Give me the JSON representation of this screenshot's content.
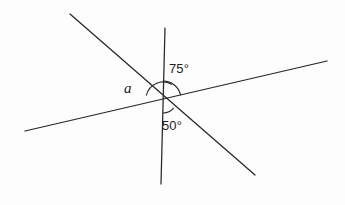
{
  "figure": {
    "background_color": "#fdfdfd",
    "stroke_color": "#272727",
    "text_color": "#1d1d1d",
    "width": 345,
    "height": 205,
    "vertex": {
      "x": 163,
      "y": 99
    },
    "lines": [
      {
        "name": "vertical-line",
        "x1": 165,
        "y1": 28,
        "x2": 161,
        "y2": 184
      },
      {
        "name": "diagonal-line-steep",
        "x1": 70,
        "y1": 14,
        "x2": 255,
        "y2": 175
      },
      {
        "name": "transversal-line-shallow",
        "x1": 25,
        "y1": 131,
        "x2": 327,
        "y2": 61
      }
    ],
    "arcs": [
      {
        "name": "arc-angle-a",
        "radius": 17,
        "start_deg": 167,
        "end_deg": 60
      },
      {
        "name": "arc-angle-75",
        "radius": 18,
        "start_deg": 89,
        "end_deg": 13
      },
      {
        "name": "arc-angle-50",
        "radius": 14,
        "start_deg": 271,
        "end_deg": 319
      }
    ],
    "labels": [
      {
        "name": "angle-label-75",
        "text": "75°",
        "x": 169,
        "y": 62
      },
      {
        "name": "angle-label-50",
        "text": "50°",
        "x": 162,
        "y": 119
      },
      {
        "name": "angle-label-a",
        "text": "a",
        "x": 124,
        "y": 81
      }
    ]
  },
  "chart_data": {
    "type": "diagram",
    "subtype": "geometry-angles-at-a-point",
    "vertex_label": "",
    "known_angles": [
      {
        "label": "75°",
        "value": 75,
        "unit": "degrees",
        "between": [
          "vertical-ray-up",
          "transversal-ray-right"
        ]
      },
      {
        "label": "50°",
        "value": 50,
        "unit": "degrees",
        "between": [
          "vertical-ray-down",
          "diagonal-ray-down-right"
        ]
      }
    ],
    "unknown_angles": [
      {
        "label": "a",
        "value": null,
        "unit": "degrees",
        "between": [
          "transversal-ray-left",
          "diagonal-ray-up-left"
        ]
      }
    ],
    "line_count": 3,
    "grid": false,
    "legend": "none"
  }
}
